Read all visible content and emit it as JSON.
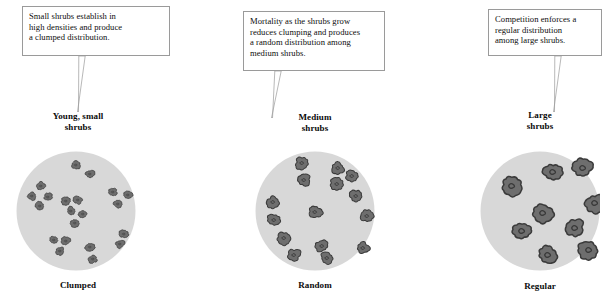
{
  "figure": {
    "colors": {
      "circle_fill": "#d8d8d8",
      "shrub_fill": "#6e6e6e",
      "shrub_stroke": "#3a3a3a",
      "box_border": "#9a9a9a",
      "box_fill": "#ffffff",
      "text": "#0d0d0d"
    }
  },
  "panels": [
    {
      "id": "clumped",
      "callout": {
        "lines": [
          "Small shrubs establish in",
          "high densities and produce",
          "a clumped distribution."
        ]
      },
      "top_label": {
        "lines": [
          "Young, small",
          "shrubs"
        ]
      },
      "bottom_label": "Clumped",
      "shrub_size": "small",
      "shrub_count": 22
    },
    {
      "id": "random",
      "callout": {
        "lines": [
          "Mortality as the shrubs grow",
          "reduces clumping and produces",
          "a random distribution among",
          "medium shrubs."
        ]
      },
      "top_label": {
        "lines": [
          "Medium",
          "shrubs"
        ]
      },
      "bottom_label": "Random",
      "shrub_size": "medium",
      "shrub_count": 15
    },
    {
      "id": "regular",
      "callout": {
        "lines": [
          "Competition enforces a",
          "regular distribution",
          "among large shrubs."
        ]
      },
      "top_label": {
        "lines": [
          "Large",
          "shrubs"
        ]
      },
      "bottom_label": "Regular",
      "shrub_size": "large",
      "shrub_count": 9
    }
  ],
  "chart_data": {
    "type": "scatter",
    "panels": [
      {
        "name": "Clumped",
        "circle": {
          "cx": 76,
          "cy": 211,
          "r": 60
        },
        "shrub_radius": 4.2,
        "points": [
          [
            76,
            165
          ],
          [
            90,
            174
          ],
          [
            41,
            186
          ],
          [
            32,
            196
          ],
          [
            48,
            197
          ],
          [
            40,
            206
          ],
          [
            66,
            201
          ],
          [
            78,
            200
          ],
          [
            71,
            211
          ],
          [
            83,
            214
          ],
          [
            75,
            223
          ],
          [
            113,
            192
          ],
          [
            128,
            195
          ],
          [
            118,
            204
          ],
          [
            124,
            234
          ],
          [
            120,
            244
          ],
          [
            54,
            240
          ],
          [
            66,
            241
          ],
          [
            60,
            251
          ],
          [
            90,
            247
          ],
          [
            93,
            259
          ]
        ]
      },
      {
        "name": "Random",
        "circle": {
          "cx": 315,
          "cy": 211,
          "r": 60
        },
        "shrub_radius": 6.0,
        "points": [
          [
            302,
            163
          ],
          [
            338,
            168
          ],
          [
            352,
            176
          ],
          [
            304,
            180
          ],
          [
            337,
            184
          ],
          [
            356,
            196
          ],
          [
            273,
            202
          ],
          [
            274,
            220
          ],
          [
            315,
            212
          ],
          [
            367,
            216
          ],
          [
            322,
            246
          ],
          [
            363,
            248
          ],
          [
            294,
            255
          ],
          [
            327,
            258
          ],
          [
            284,
            238
          ]
        ]
      },
      {
        "name": "Regular",
        "circle": {
          "cx": 540,
          "cy": 211,
          "r": 60
        },
        "shrub_radius": 9.0,
        "points": [
          [
            553,
            172
          ],
          [
            583,
            168
          ],
          [
            512,
            186
          ],
          [
            595,
            203
          ],
          [
            543,
            213
          ],
          [
            522,
            231
          ],
          [
            575,
            228
          ],
          [
            548,
            255
          ],
          [
            589,
            250
          ]
        ]
      }
    ],
    "xlabel": "",
    "ylabel": "",
    "legend": [
      "Clumped",
      "Random",
      "Regular"
    ]
  }
}
